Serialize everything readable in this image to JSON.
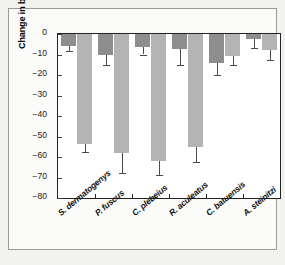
{
  "chart_data": {
    "type": "bar",
    "title": "",
    "xlabel": "",
    "ylabel": "Change in bite rate (per 5 min observation)",
    "ylim": [
      -80,
      0
    ],
    "grid": false,
    "legend": "none",
    "ytick_labels": [
      "0",
      "−10",
      "−20",
      "−30",
      "−40",
      "−50",
      "−60",
      "−70",
      "−80"
    ],
    "ytick_values": [
      0,
      -10,
      -20,
      -30,
      -40,
      -50,
      -60,
      -70,
      -80
    ],
    "categories": [
      "S. dermatogenys",
      "P. fuscus",
      "C. plebeius",
      "R. aculeatus",
      "C. batuensis",
      "A. steinitzi"
    ],
    "series": [
      {
        "name": "dark-bar",
        "color": "#8e8e8e",
        "values": [
          -6.0,
          -10.0,
          -6.5,
          -7.5,
          -14.0,
          -2.5
        ],
        "errors_lower": [
          -8.5,
          -15.0,
          -10.0,
          -15.0,
          -20.0,
          -7.0
        ]
      },
      {
        "name": "light-bar",
        "color": "#b4b4b4",
        "values": [
          -53.5,
          -58.0,
          -62.0,
          -55.0,
          -10.5,
          -8.0
        ],
        "errors_lower": [
          -57.5,
          -68.0,
          -69.0,
          -62.5,
          -15.0,
          -12.5
        ]
      }
    ]
  },
  "figure": {
    "background": "#fbfbfa",
    "axis_color": "#222222",
    "frame_color": "#9a9a96"
  }
}
